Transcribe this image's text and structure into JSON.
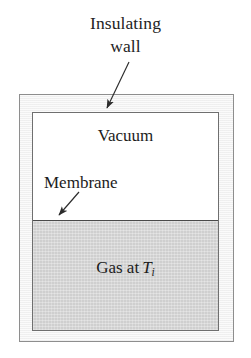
{
  "figure": {
    "caption": "Insulating\nwall",
    "labels": {
      "vacuum": "Vacuum",
      "membrane": "Membrane",
      "gas_prefix": "Gas at",
      "gas_symbol": "T",
      "gas_subscript": "i"
    },
    "colors": {
      "page_background": "#ffffff",
      "gas_fill": "#cfcfcf",
      "vacuum_fill": "#ffffff",
      "wall_fill": "#fbfbfb",
      "outer_border": "#8e8e8e",
      "inner_border": "#6f6f6f",
      "membrane": "#4a4a4a",
      "text": "#1c1c1c",
      "arrow": "#2b2b2b"
    },
    "geometry": {
      "outer_box": {
        "x": 19,
        "y": 94,
        "width": 215,
        "height": 248
      },
      "inner_box": {
        "x": 32,
        "y": 112,
        "width": 187,
        "height": 219
      },
      "membrane_y": 220,
      "vacuum_height": 107,
      "gas_height": 111
    },
    "arrows": [
      {
        "name": "insulating-wall-arrow",
        "x1": 129,
        "y1": 62,
        "x2": 105,
        "y2": 111
      },
      {
        "name": "membrane-arrow",
        "x1": 79,
        "y1": 192,
        "x2": 57,
        "y2": 218
      }
    ]
  }
}
